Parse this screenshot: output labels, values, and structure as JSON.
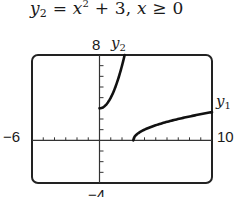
{
  "equation": {
    "lhs_var": "y",
    "lhs_sub": "2",
    "rhs_var": "x",
    "rhs_exp": "2",
    "rhs_rest": " + 3, ",
    "cond_var": "x",
    "cond_rest": " ≥ 0"
  },
  "labels": {
    "ymax": "8",
    "ymin": "−4",
    "xmin": "−6",
    "xmax": "10",
    "y1_var": "y",
    "y1_sub": "1",
    "y2_var": "y",
    "y2_sub": "2"
  },
  "colors": {
    "curve": "#111111",
    "frame": "#222222",
    "axis": "#333333"
  },
  "chart_data": {
    "type": "line",
    "xlabel": "",
    "ylabel": "",
    "xlim": [
      -6,
      10
    ],
    "ylim": [
      -4,
      8
    ],
    "xtick_step": 1,
    "ytick_step": 1,
    "grid": false,
    "legend": "inline labels: y2 near top of curve, y1 at right end",
    "series": [
      {
        "name": "y2",
        "formula": "x^2 + 3, x >= 0",
        "x": [
          0,
          0.5,
          1,
          1.5,
          2,
          2.24
        ],
        "y": [
          3,
          3.25,
          4,
          5.25,
          7,
          8
        ]
      },
      {
        "name": "y1",
        "formula": "sqrt(x - 3)",
        "x": [
          3,
          3.25,
          4,
          5,
          6,
          7,
          8,
          9,
          10
        ],
        "y": [
          0,
          0.5,
          1,
          1.41,
          1.73,
          2,
          2.24,
          2.45,
          2.65
        ]
      }
    ]
  }
}
